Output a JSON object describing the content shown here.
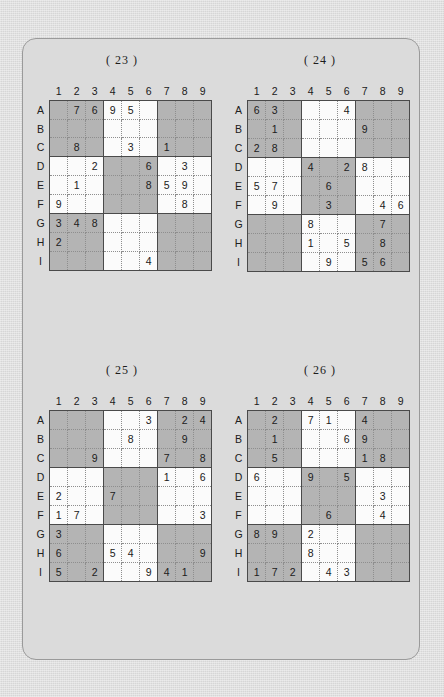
{
  "page": {
    "background_color": "#dcdcdc",
    "sheet_color": "#dbdbdb",
    "border_color": "#9a9a9a",
    "shaded_cell_color": "#b4b4b4",
    "empty_cell_color": "#fbfbfb",
    "grid_line_color": "#8e8e8e",
    "block_line_color": "#4a4a4a"
  },
  "column_headers": [
    "1",
    "2",
    "3",
    "4",
    "5",
    "6",
    "7",
    "8",
    "9"
  ],
  "row_headers": [
    "A",
    "B",
    "C",
    "D",
    "E",
    "F",
    "G",
    "H",
    "I"
  ],
  "shaded_blocks": [
    1,
    3,
    5,
    7,
    9
  ],
  "puzzles": [
    {
      "label": "( 23 )",
      "number": 23,
      "rows": [
        [
          "",
          "7",
          "6",
          "9",
          "5",
          "",
          "",
          "",
          ""
        ],
        [
          "",
          "",
          "",
          "",
          "",
          "",
          "",
          "",
          ""
        ],
        [
          "",
          "8",
          "",
          "",
          "3",
          "",
          "1",
          "",
          ""
        ],
        [
          "",
          "",
          "2",
          "",
          "",
          "6",
          "",
          "3",
          ""
        ],
        [
          "",
          "1",
          "",
          "",
          "",
          "8",
          "5",
          "9",
          ""
        ],
        [
          "9",
          "",
          "",
          "",
          "",
          "",
          "",
          "8",
          ""
        ],
        [
          "3",
          "4",
          "8",
          "",
          "",
          "",
          "",
          "",
          ""
        ],
        [
          "2",
          "",
          "",
          "",
          "",
          "",
          "",
          "",
          ""
        ],
        [
          "",
          "",
          "",
          "",
          "",
          "4",
          "",
          "",
          ""
        ]
      ]
    },
    {
      "label": "( 24 )",
      "number": 24,
      "rows": [
        [
          "6",
          "3",
          "",
          "",
          "",
          "4",
          "",
          "",
          ""
        ],
        [
          "",
          "1",
          "",
          "",
          "",
          "",
          "9",
          "",
          ""
        ],
        [
          "2",
          "8",
          "",
          "",
          "",
          "",
          "",
          "",
          ""
        ],
        [
          "",
          "",
          "",
          "4",
          "",
          "2",
          "8",
          "",
          ""
        ],
        [
          "5",
          "7",
          "",
          "",
          "6",
          "",
          "",
          "",
          ""
        ],
        [
          "",
          "9",
          "",
          "",
          "3",
          "",
          "",
          "4",
          "6"
        ],
        [
          "",
          "",
          "",
          "8",
          "",
          "",
          "",
          "7",
          ""
        ],
        [
          "",
          "",
          "",
          "1",
          "",
          "5",
          "",
          "8",
          ""
        ],
        [
          "",
          "",
          "",
          "",
          "9",
          "",
          "5",
          "6",
          ""
        ]
      ]
    },
    {
      "label": "( 25 )",
      "number": 25,
      "rows": [
        [
          "",
          "",
          "",
          "",
          "",
          "3",
          "",
          "2",
          "4"
        ],
        [
          "",
          "",
          "",
          "",
          "8",
          "",
          "",
          "9",
          ""
        ],
        [
          "",
          "",
          "9",
          "",
          "",
          "",
          "7",
          "",
          "8"
        ],
        [
          "",
          "",
          "",
          "",
          "",
          "",
          "1",
          "",
          "6"
        ],
        [
          "2",
          "",
          "",
          "7",
          "",
          "",
          "",
          "",
          ""
        ],
        [
          "1",
          "7",
          "",
          "",
          "",
          "",
          "",
          "",
          "3"
        ],
        [
          "3",
          "",
          "",
          "",
          "",
          "",
          "",
          "",
          ""
        ],
        [
          "6",
          "",
          "",
          "5",
          "4",
          "",
          "",
          "",
          "9"
        ],
        [
          "5",
          "",
          "2",
          "",
          "",
          "9",
          "4",
          "1",
          ""
        ]
      ]
    },
    {
      "label": "( 26 )",
      "number": 26,
      "rows": [
        [
          "",
          "2",
          "",
          "7",
          "1",
          "",
          "4",
          "",
          ""
        ],
        [
          "",
          "1",
          "",
          "",
          "",
          "6",
          "9",
          "",
          ""
        ],
        [
          "",
          "5",
          "",
          "",
          "",
          "",
          "1",
          "8",
          ""
        ],
        [
          "6",
          "",
          "",
          "9",
          "",
          "5",
          "",
          "",
          ""
        ],
        [
          "",
          "",
          "",
          "",
          "",
          "",
          "",
          "3",
          ""
        ],
        [
          "",
          "",
          "",
          "",
          "6",
          "",
          "",
          "4",
          ""
        ],
        [
          "8",
          "9",
          "",
          "2",
          "",
          "",
          "",
          "",
          ""
        ],
        [
          "",
          "",
          "",
          "8",
          "",
          "",
          "",
          "",
          ""
        ],
        [
          "1",
          "7",
          "2",
          "",
          "4",
          "3",
          "",
          "",
          ""
        ]
      ]
    }
  ]
}
